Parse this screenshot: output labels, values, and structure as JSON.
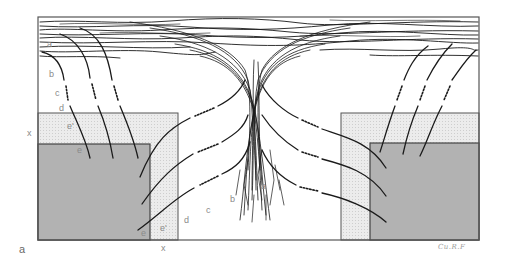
{
  "panel_label": "a",
  "signature": "Cu.R.F",
  "regions": {
    "outer_frame": {
      "x": 38,
      "y": 17,
      "w": 441,
      "h": 223
    },
    "fiber_band": {
      "x": 38,
      "y": 17,
      "w": 441,
      "h": 42
    },
    "left_light_box": {
      "x": 38,
      "y": 113,
      "w": 140,
      "h": 127
    },
    "left_dark_box": {
      "x": 38,
      "y": 144,
      "w": 112,
      "h": 96
    },
    "right_light_box": {
      "x": 341,
      "y": 113,
      "w": 138,
      "h": 127
    },
    "right_dark_box": {
      "x": 370,
      "y": 143,
      "w": 109,
      "h": 97
    }
  },
  "colors": {
    "line": "#1a1a1a",
    "frame": "#555555",
    "light_fill": "#e6e6e6",
    "dark_fill": "#bdbdbd",
    "label": "#8a8a8a"
  },
  "labels": {
    "left_column": [
      {
        "text": "a",
        "x": 47,
        "y": 40
      },
      {
        "text": "b",
        "x": 49,
        "y": 70
      },
      {
        "text": "c",
        "x": 55,
        "y": 89
      },
      {
        "text": "d",
        "x": 59,
        "y": 104
      },
      {
        "text": "e'",
        "x": 67,
        "y": 122
      },
      {
        "text": "e",
        "x": 77,
        "y": 146
      },
      {
        "text": "x",
        "x": 27,
        "y": 129
      }
    ],
    "bottom_row": [
      {
        "text": "e",
        "x": 141,
        "y": 229
      },
      {
        "text": "e'",
        "x": 160,
        "y": 224
      },
      {
        "text": "d",
        "x": 184,
        "y": 216
      },
      {
        "text": "c",
        "x": 206,
        "y": 206
      },
      {
        "text": "b",
        "x": 230,
        "y": 195
      },
      {
        "text": "a",
        "x": 261,
        "y": 182
      },
      {
        "text": "x",
        "x": 161,
        "y": 244
      }
    ]
  }
}
